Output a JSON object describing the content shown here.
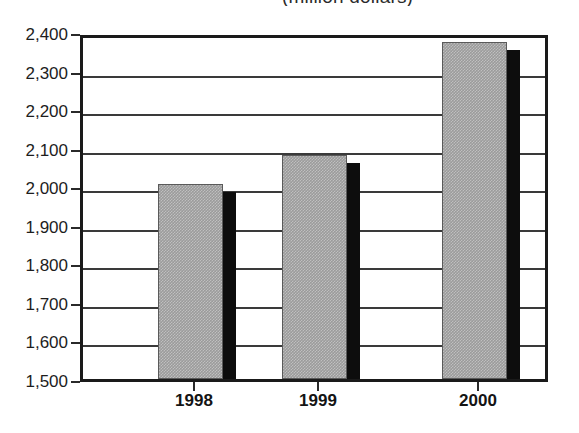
{
  "chart_data": {
    "type": "bar",
    "title": "(million dollars)",
    "xlabel": "",
    "ylabel": "",
    "categories": [
      "1998",
      "1999",
      "2000"
    ],
    "values": [
      2005,
      2080,
      2375
    ],
    "ylim": [
      1500,
      2400
    ],
    "yticks": [
      1500,
      1600,
      1700,
      1800,
      1900,
      2000,
      2100,
      2200,
      2300,
      2400
    ],
    "ytick_labels": [
      "1,500",
      "1,600",
      "1,700",
      "1,800",
      "1,900",
      "2,000",
      "2,100",
      "2,200",
      "2,300",
      "2,400"
    ],
    "grid": true,
    "legend": false,
    "series": [
      {
        "name": "Value",
        "values": [
          2005,
          2080,
          2375
        ]
      }
    ],
    "style": {
      "bar_fill": "#9b9b9b",
      "bar_shadow": "#0d0d0d",
      "axis_color": "#1a1a1a",
      "background": "#ffffff"
    }
  },
  "axis": {
    "y_labels": [
      {
        "text": "2,400",
        "value": 2400
      },
      {
        "text": "2,300",
        "value": 2300
      },
      {
        "text": "2,200",
        "value": 2200
      },
      {
        "text": "2,100",
        "value": 2100
      },
      {
        "text": "2,000",
        "value": 2000
      },
      {
        "text": "1,900",
        "value": 1900
      },
      {
        "text": "1,800",
        "value": 1800
      },
      {
        "text": "1,700",
        "value": 1700
      },
      {
        "text": "1,600",
        "value": 1600
      },
      {
        "text": "1,500",
        "value": 1500
      }
    ],
    "x_labels": [
      "1998",
      "1999",
      "2000"
    ]
  }
}
